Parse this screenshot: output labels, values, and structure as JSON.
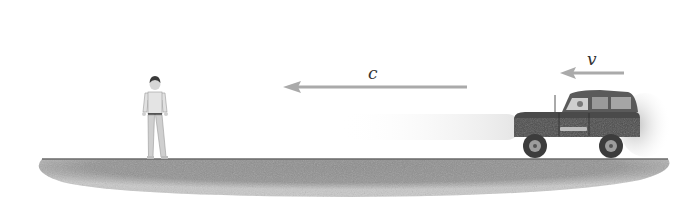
{
  "diagram": {
    "labels": {
      "light_speed": "c",
      "vehicle_speed": "v"
    },
    "elements": {
      "observer": {
        "position_x": 155,
        "facing": "viewer"
      },
      "light_arrow": {
        "x_start": 467,
        "x_end": 283,
        "y": 87,
        "direction": "left"
      },
      "velocity_arrow": {
        "x_start": 624,
        "x_end": 560,
        "y": 73,
        "direction": "left"
      },
      "vehicle": {
        "type": "jeep",
        "position_x": 513,
        "direction": "left"
      }
    },
    "colors": {
      "ground": "#8a8a8a",
      "arrow": "#b0b0b0",
      "vehicle_body": "#4a4a4a",
      "label_text": "#333333"
    }
  }
}
